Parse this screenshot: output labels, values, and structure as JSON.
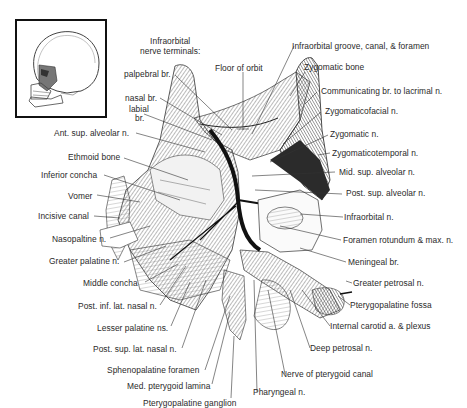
{
  "figure": {
    "inset": {
      "description": "lateral-skull-orientation"
    },
    "header_label": {
      "line1": "Infraorbital",
      "line2": "nerve terminals:"
    },
    "labels_top": [
      {
        "id": "palpebral",
        "text": "palpebral br."
      },
      {
        "id": "nasal",
        "text": "nasal br."
      },
      {
        "id": "labial1",
        "text": "labial"
      },
      {
        "id": "labial2",
        "text": "br."
      },
      {
        "id": "floor-orbit",
        "text": "Floor of orbit"
      },
      {
        "id": "infraorbital-groove",
        "text": "Infraorbital groove, canal, & foramen"
      },
      {
        "id": "zygomatic-bone",
        "text": "Zygomatic bone"
      }
    ],
    "labels_left": [
      "Ant. sup. alveolar n.",
      "Ethmoid bone",
      "Inferior concha",
      "Vomer",
      "Incisive canal",
      "Nasopaltine n.",
      "Greater palatine n.",
      "Middle concha",
      "Post. inf. lat. nasal n.",
      "Lesser palatine ns.",
      "Post. sup. lat. nasal n.",
      "Sphenopalatine foramen",
      "Med. pterygoid lamina",
      "Pterygopalatine ganglion"
    ],
    "labels_right": [
      "Communicating br. to lacrimal n.",
      "Zygomaticofacial n.",
      "Zygomatic n.",
      "Zygomaticotemporal n.",
      "Mid. sup. alveolar n.",
      "Post. sup. alveolar n.",
      "Infraorbital n.",
      "Foramen rotundum & max. n.",
      "Meningeal br.",
      "Greater petrosal n.",
      "Pterygopalatine fossa",
      "Internal carotid a. & plexus",
      "Deep petrosal n.",
      "Nerve of pterygoid canal",
      "Pharyngeal n."
    ]
  }
}
